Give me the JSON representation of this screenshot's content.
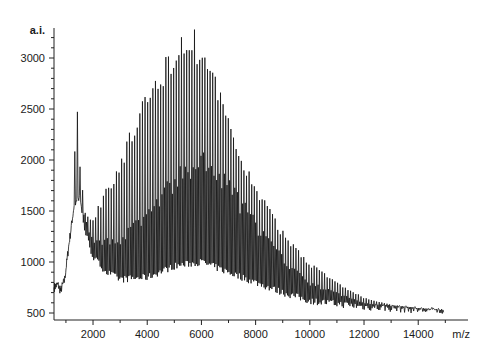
{
  "chart_data": {
    "type": "line",
    "title": "",
    "xlabel": "m/z",
    "ylabel": "a.i.",
    "xlim": [
      560,
      14900
    ],
    "ylim": [
      470,
      3300
    ],
    "x_ticks": [
      2000,
      4000,
      6000,
      8000,
      10000,
      12000,
      14000
    ],
    "x_tick_labels": [
      "2000",
      "4000",
      "6000",
      "8000",
      "10000",
      "12000",
      "14000"
    ],
    "x_minor_step": 1000,
    "y_ticks": [
      500,
      1000,
      1500,
      2000,
      2500,
      3000
    ],
    "y_tick_labels": [
      "500",
      "1000",
      "1500",
      "2000",
      "2500",
      "3000"
    ],
    "y_minor_step": 100,
    "grid": false,
    "legend": null,
    "line_color": "#111111",
    "peak_spacing_mz": 96,
    "series": [
      {
        "name": "upper_envelope",
        "x": [
          1300,
          1400,
          1500,
          1700,
          2000,
          2500,
          3000,
          3500,
          4000,
          4500,
          5000,
          5400,
          5700,
          6000,
          6500,
          7000,
          7500,
          8000,
          9000,
          10000,
          11000,
          12000,
          13000,
          14000,
          14800
        ],
        "values": [
          1900,
          2620,
          2000,
          1500,
          1420,
          1750,
          2000,
          2350,
          2650,
          2900,
          3150,
          3320,
          3250,
          3150,
          2800,
          2400,
          2050,
          1750,
          1300,
          1000,
          800,
          650,
          580,
          550,
          540
        ]
      },
      {
        "name": "secondary_envelope",
        "x": [
          1500,
          2000,
          3000,
          4000,
          5000,
          6000,
          7000,
          8000,
          9000,
          10000,
          12000,
          14800
        ],
        "values": [
          1600,
          1200,
          1250,
          1500,
          1850,
          2050,
          1800,
          1400,
          1050,
          800,
          600,
          530
        ]
      },
      {
        "name": "baseline",
        "x": [
          560,
          700,
          800,
          950,
          1100,
          1300,
          1500,
          1700,
          2000,
          2500,
          3000,
          4000,
          5000,
          6000,
          7000,
          8000,
          9000,
          10000,
          12000,
          14000,
          14800
        ],
        "values": [
          750,
          780,
          720,
          820,
          1150,
          1550,
          1650,
          1300,
          1050,
          900,
          830,
          850,
          960,
          1000,
          900,
          800,
          700,
          620,
          560,
          530,
          520
        ]
      }
    ],
    "annotations": [
      {
        "label": "max peak",
        "x": 5400,
        "y": 3320
      },
      {
        "label": "low-mass spike",
        "x": 1400,
        "y": 2620
      }
    ]
  }
}
